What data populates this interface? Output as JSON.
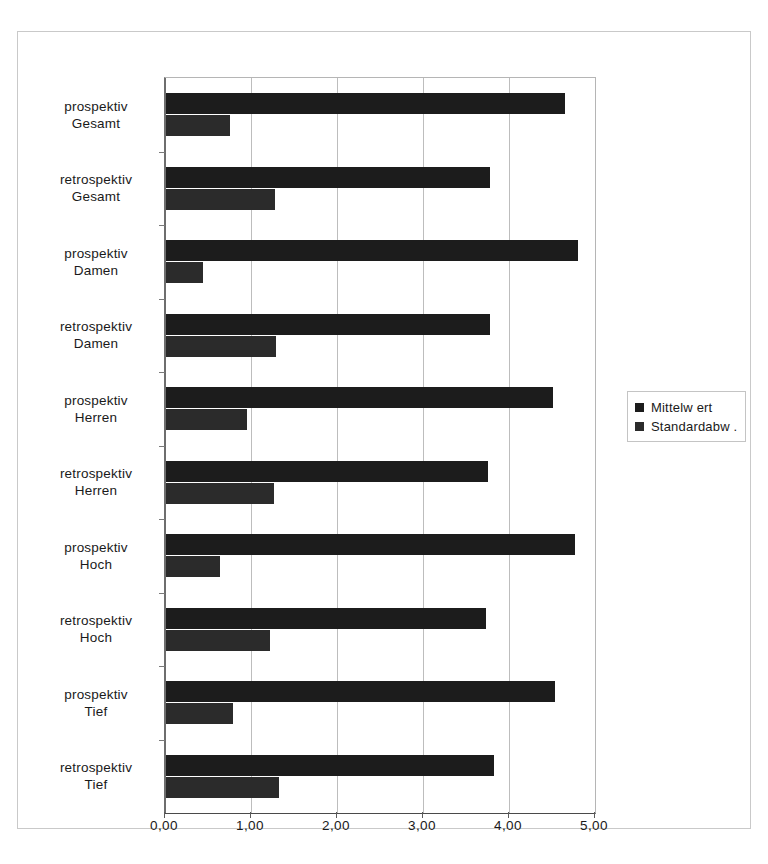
{
  "chart_data": {
    "type": "bar",
    "orientation": "horizontal",
    "title": "",
    "xlabel": "",
    "ylabel": "",
    "xlim": [
      0,
      5
    ],
    "xticks": [
      "0,00",
      "1,00",
      "2,00",
      "3,00",
      "4,00",
      "5,00"
    ],
    "xtick_values": [
      0,
      1,
      2,
      3,
      4,
      5
    ],
    "grid": true,
    "legend_position": "right",
    "categories": [
      "prospektiv Gesamt",
      "retrospektiv Gesamt",
      "prospektiv Damen",
      "retrospektiv Damen",
      "prospektiv Herren",
      "retrospektiv Herren",
      "prospektiv Hoch",
      "retrospektiv Hoch",
      "prospektiv Tief",
      "retrospektiv Tief"
    ],
    "category_lines": [
      [
        "prospektiv",
        "Gesamt"
      ],
      [
        "retrospektiv",
        "Gesamt"
      ],
      [
        "prospektiv",
        "Damen"
      ],
      [
        "retrospektiv",
        "Damen"
      ],
      [
        "prospektiv",
        "Herren"
      ],
      [
        "retrospektiv",
        "Herren"
      ],
      [
        "prospektiv",
        "Hoch"
      ],
      [
        "retrospektiv",
        "Hoch"
      ],
      [
        "prospektiv",
        "Tief"
      ],
      [
        "retrospektiv",
        "Tief"
      ]
    ],
    "series": [
      {
        "name": "Mittelw ert",
        "color": "#1c1c1c",
        "values": [
          4.64,
          3.77,
          4.79,
          3.77,
          4.5,
          3.74,
          4.76,
          3.72,
          4.52,
          3.81
        ]
      },
      {
        "name": "Standardabw .",
        "color": "#2b2b2b",
        "values": [
          0.74,
          1.27,
          0.43,
          1.28,
          0.94,
          1.26,
          0.63,
          1.21,
          0.78,
          1.31
        ]
      }
    ]
  },
  "legend": {
    "entries": [
      {
        "label": "Mittelw ert"
      },
      {
        "label": "Standardabw ."
      }
    ]
  },
  "colors": {
    "series_1": "#1c1c1c",
    "series_2": "#2b2b2b",
    "grid": "#bdbdbd",
    "axis": "#6e6e6e",
    "frame": "#c9c9c9"
  }
}
